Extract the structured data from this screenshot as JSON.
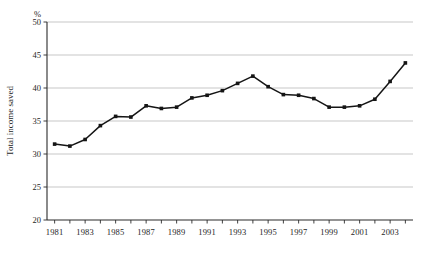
{
  "chart_data": {
    "type": "line",
    "title": "",
    "subtitle": "",
    "xlabel": "",
    "ylabel": "Total income saved",
    "unit_label": "%",
    "ylim": [
      20,
      50
    ],
    "ytick_values": [
      20,
      25,
      30,
      35,
      40,
      45,
      50
    ],
    "ytick_labels": [
      "20",
      "25",
      "30",
      "35",
      "40",
      "45",
      "50"
    ],
    "xlim": [
      1980.5,
      2004.5
    ],
    "x": [
      1981,
      1982,
      1983,
      1984,
      1985,
      1986,
      1987,
      1988,
      1989,
      1990,
      1991,
      1992,
      1993,
      1994,
      1995,
      1996,
      1997,
      1998,
      1999,
      2000,
      2001,
      2002,
      2003,
      2004
    ],
    "xtick_values": [
      1981,
      1982,
      1983,
      1984,
      1985,
      1986,
      1987,
      1988,
      1989,
      1990,
      1991,
      1992,
      1993,
      1994,
      1995,
      1996,
      1997,
      1998,
      1999,
      2000,
      2001,
      2002,
      2003,
      2004
    ],
    "xtick_labels": [
      "1981",
      "",
      "1983",
      "",
      "1985",
      "",
      "1987",
      "",
      "1989",
      "",
      "1991",
      "",
      "1993",
      "",
      "1995",
      "",
      "1997",
      "",
      "1999",
      "",
      "2001",
      "",
      "2003",
      ""
    ],
    "values": [
      31.5,
      31.2,
      32.2,
      34.3,
      35.7,
      35.6,
      37.3,
      36.9,
      37.1,
      38.5,
      38.9,
      39.6,
      40.7,
      41.8,
      40.2,
      39.0,
      38.9,
      38.4,
      37.1,
      37.1,
      37.3,
      38.3,
      41.0,
      43.8
    ],
    "series": [
      {
        "name": "Total income saved",
        "color": "#151515",
        "marker": "square",
        "values": [
          31.5,
          31.2,
          32.2,
          34.3,
          35.7,
          35.6,
          37.3,
          36.9,
          37.1,
          38.5,
          38.9,
          39.6,
          40.7,
          41.8,
          40.2,
          39.0,
          38.9,
          38.4,
          37.1,
          37.1,
          37.3,
          38.3,
          41.0,
          43.8
        ]
      }
    ],
    "grid": {
      "horizontal": true,
      "vertical": false,
      "color": "#b9b9b9"
    },
    "legend": {
      "visible": false,
      "position": "none",
      "entries": []
    },
    "annotations": []
  },
  "plot_geometry": {
    "left": 47,
    "right": 413,
    "top": 22,
    "bottom": 220
  }
}
